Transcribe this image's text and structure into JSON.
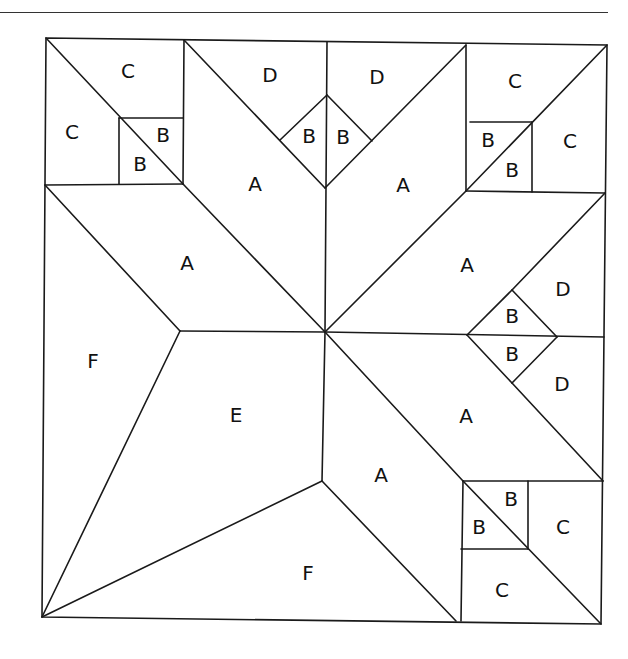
{
  "header": {
    "partial_text": "( p g",
    "closing_paren": ")"
  },
  "diagram": {
    "line_color": "#1a1a1a",
    "background": "#ffffff",
    "labels": {
      "tl_c_top": "C",
      "tl_c_left": "C",
      "tl_b_upper": "B",
      "tl_b_lower": "B",
      "top_d_left": "D",
      "top_d_right": "D",
      "top_b_left": "B",
      "top_b_right": "B",
      "top_a_left": "A",
      "top_a_right": "A",
      "tr_c_top": "C",
      "tr_c_right": "C",
      "tr_b_upper": "B",
      "tr_b_lower": "B",
      "left_a": "A",
      "right_a_upper": "A",
      "right_d_upper": "D",
      "right_b_upper": "B",
      "right_b_lower": "B",
      "right_d_lower": "D",
      "right_a_lower": "A",
      "f_left": "F",
      "e_center": "E",
      "a_bottom_center": "A",
      "f_bottom": "F",
      "br_b_upper": "B",
      "br_b_lower": "B",
      "br_c_right": "C",
      "br_c_bottom": "C"
    }
  }
}
